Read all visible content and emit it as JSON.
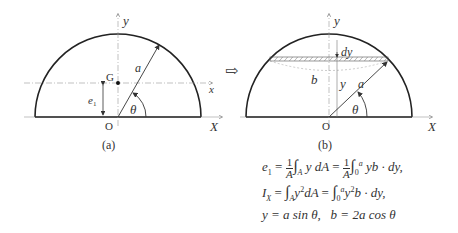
{
  "figure_a": {
    "caption": "(a)",
    "labels": {
      "y_axis": "y",
      "x_axis": "x",
      "X_axis": "X",
      "origin": "O",
      "centroid": "G",
      "radius": "a",
      "angle": "θ",
      "offset": "e",
      "offset_sub": "1"
    }
  },
  "figure_b": {
    "caption": "(b)",
    "labels": {
      "y_axis": "y",
      "X_axis": "X",
      "origin": "O",
      "strip_thickness": "dy",
      "strip_width": "b",
      "height": "y",
      "radius": "a",
      "angle": "θ"
    }
  },
  "arrow": "⇨",
  "formulas": {
    "line1": {
      "lhs": "e",
      "lhs_sub": "1",
      "eq": "=",
      "frac_num": "1",
      "frac_den": "A",
      "int1_sub": "A",
      "body1": "y dA",
      "int2_sub": "0",
      "int2_sup": "a",
      "body2": "yb · dy,"
    },
    "line2": {
      "lhs": "I",
      "lhs_sub": "X",
      "int1_sub": "A",
      "body1": "y",
      "body1_sup": "2",
      "body1b": "dA",
      "int2_sub": "0",
      "int2_sup": "a",
      "body2": "y",
      "body2_sup": "2",
      "body2b": "b · dy,"
    },
    "line3": {
      "text1": "y = a sin θ,",
      "text2": "b = 2a cos θ"
    }
  }
}
